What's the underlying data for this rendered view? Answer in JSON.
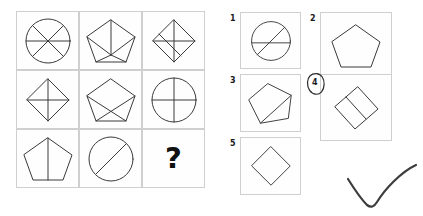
{
  "puzzle": {
    "type": "matrix-reasoning",
    "prompt_symbol": "?",
    "stroke_color": "#3a3a3a",
    "frame_color": "#cfcfcf",
    "ink_color": "#2b2b2b",
    "background_color": "#ffffff"
  },
  "matrix": {
    "rows": 3,
    "columns": 3,
    "cells": [
      {
        "position": "row1-col1",
        "shape": "circle",
        "divider_count": 3,
        "description": "circle divided into six sectors by three lines"
      },
      {
        "position": "row1-col2",
        "shape": "pentagon",
        "divider_count": 5,
        "description": "pentagon with lines from every vertex to a central point"
      },
      {
        "position": "row1-col3",
        "shape": "diamond",
        "divider_count": 3,
        "description": "diamond with both diagonals plus one extra line"
      },
      {
        "position": "row2-col1",
        "shape": "diamond",
        "divider_count": 2,
        "description": "diamond with horizontal and vertical diagonals"
      },
      {
        "position": "row2-col2",
        "shape": "pentagon",
        "divider_count": 2,
        "description": "pentagon with two crossing lines forming an X in the lower half"
      },
      {
        "position": "row2-col3",
        "shape": "circle",
        "divider_count": 2,
        "description": "circle with vertical and horizontal diameters"
      },
      {
        "position": "row3-col1",
        "shape": "pentagon",
        "divider_count": 1,
        "description": "pentagon with a single vertical line from apex to base"
      },
      {
        "position": "row3-col2",
        "shape": "circle",
        "divider_count": 1,
        "description": "circle with a single diagonal line"
      },
      {
        "position": "row3-col3",
        "shape": "question",
        "divider_count": 0,
        "description": "missing tile marked with a question mark"
      }
    ]
  },
  "options": {
    "items": [
      {
        "number": "1",
        "shape": "circle",
        "divider_count": 2,
        "description": "circle with a diagonal line and a horizontal line"
      },
      {
        "number": "2",
        "shape": "pentagon",
        "divider_count": 0,
        "description": "plain pentagon with no internal lines"
      },
      {
        "number": "3",
        "shape": "pentagon",
        "divider_count": 1,
        "description": "tilted pentagon with one internal diagonal line"
      },
      {
        "number": "4",
        "shape": "diamond",
        "divider_count": 1,
        "description": "tilted diamond with one internal line"
      },
      {
        "number": "5",
        "shape": "diamond",
        "divider_count": 0,
        "description": "plain diamond with no internal lines"
      }
    ],
    "selected_number": "4"
  },
  "annotations": {
    "answer_ring": {
      "target_option": "4",
      "style": "hand-drawn oval"
    },
    "check_mark": {
      "style": "hand-drawn check",
      "meaning": "correct"
    }
  }
}
